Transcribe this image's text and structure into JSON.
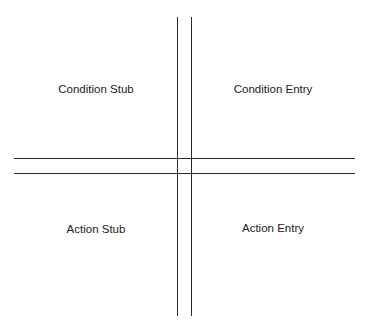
{
  "diagram": {
    "title": "",
    "quadrants": {
      "top_left": "Condition Stub",
      "top_right": "Condition Entry",
      "bottom_left": "Action Stub",
      "bottom_right": "Action Entry"
    }
  }
}
